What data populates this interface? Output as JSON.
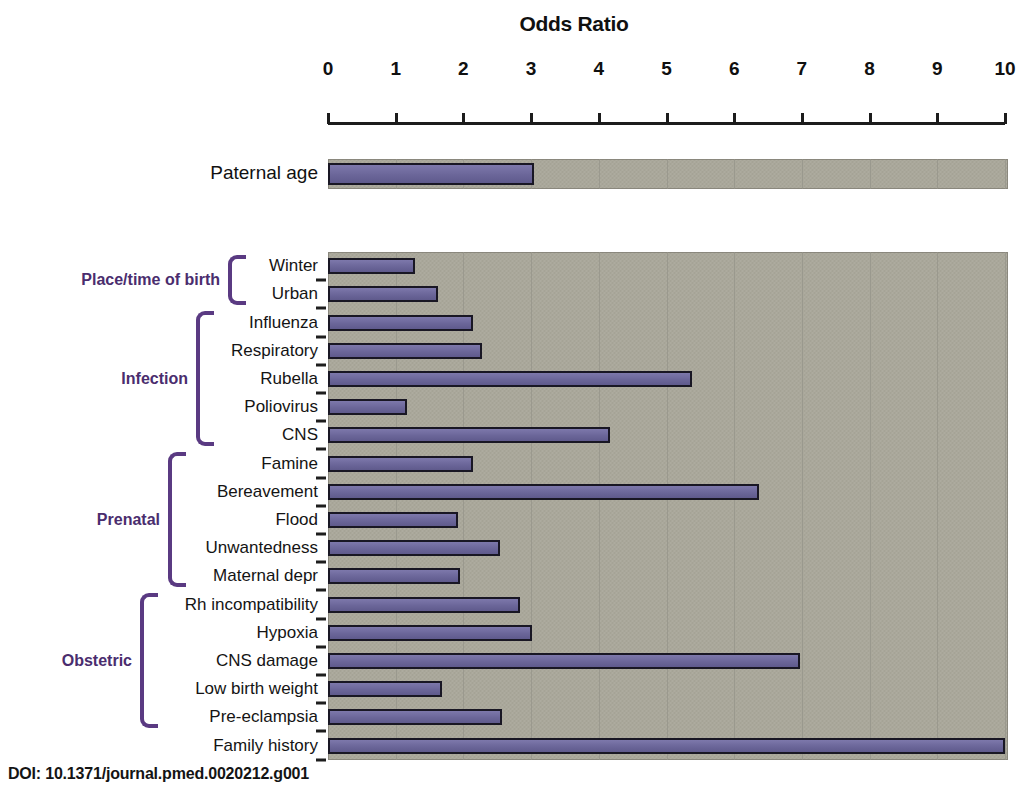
{
  "figure": {
    "doi_caption": "DOI: 10.1371/journal.pmed.0020212.g001"
  },
  "chart_data": {
    "type": "bar",
    "orientation": "horizontal",
    "title": "Odds Ratio",
    "xlabel": "Odds Ratio",
    "ylabel": "",
    "xlim": [
      0,
      10
    ],
    "xticks": [
      0,
      1,
      2,
      3,
      4,
      5,
      6,
      7,
      8,
      9,
      10
    ],
    "xtick_labels": [
      "0",
      "1",
      "2",
      "3",
      "4",
      "5",
      "6",
      "7",
      "8",
      "9",
      "10"
    ],
    "grid": true,
    "legend": false,
    "panels": [
      {
        "name": "paternal-age-panel",
        "categories": [
          "Paternal age"
        ],
        "values": [
          3.05
        ]
      },
      {
        "name": "risk-factor-panel",
        "categories": [
          "Winter",
          "Urban",
          "Influenza",
          "Respiratory",
          "Rubella",
          "Poliovirus",
          "CNS",
          "Famine",
          "Bereavement",
          "Flood",
          "Unwantedness",
          "Maternal depr",
          "Rh incompatibility",
          "Hypoxia",
          "CNS damage",
          "Low birth weight",
          "Pre-eclampsia",
          "Family history"
        ],
        "values": [
          1.28,
          1.63,
          2.14,
          2.28,
          5.37,
          1.17,
          4.16,
          2.14,
          6.36,
          1.92,
          2.54,
          1.95,
          2.83,
          3.02,
          6.97,
          1.69,
          2.57,
          10.0
        ]
      }
    ],
    "groups": [
      {
        "label": "Place/time of birth",
        "first": 0,
        "last": 1
      },
      {
        "label": "Infection",
        "first": 2,
        "last": 6
      },
      {
        "label": "Prenatal",
        "first": 7,
        "last": 11
      },
      {
        "label": "Obstetric",
        "first": 12,
        "last": 16
      }
    ],
    "colors": {
      "bar_fill": "#6b6699",
      "bar_outline": "#191724",
      "plot_background": "#a9a79a",
      "bracket": "#5a3a82",
      "group_label": "#4a2d6e",
      "axis": "#1c1c1c"
    }
  }
}
